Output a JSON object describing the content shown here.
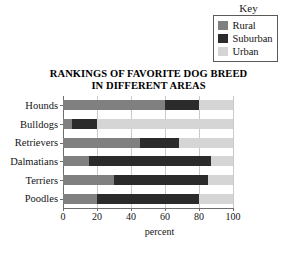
{
  "legend": {
    "title": "Key",
    "position": "top-right",
    "entries": [
      {
        "label": "Rural",
        "color": "#808080"
      },
      {
        "label": "Suburban",
        "color": "#2b2b2b"
      },
      {
        "label": "Urban",
        "color": "#d5d5d5"
      }
    ]
  },
  "chart_data": {
    "type": "bar",
    "orientation": "horizontal",
    "stacked": true,
    "title": "RANKINGS OF FAVORITE DOG BREED IN DIFFERENT AREAS",
    "title_line1": "RANKINGS OF FAVORITE DOG BREED",
    "title_line2": "IN DIFFERENT AREAS",
    "xlabel": "percent",
    "ylabel": "",
    "xlim": [
      0,
      100
    ],
    "xticks": [
      0,
      20,
      40,
      60,
      80,
      100
    ],
    "xtick_labels": [
      "0",
      "20",
      "40",
      "60",
      "80",
      "100"
    ],
    "grid": true,
    "categories": [
      "Hounds",
      "Bulldogs",
      "Retrievers",
      "Dalmatians",
      "Terriers",
      "Poodles"
    ],
    "series": [
      {
        "name": "Rural",
        "color": "#808080",
        "values": [
          60,
          5,
          45,
          15,
          30,
          20
        ]
      },
      {
        "name": "Suburban",
        "color": "#2b2b2b",
        "values": [
          20,
          15,
          23,
          72,
          55,
          60
        ]
      },
      {
        "name": "Urban",
        "color": "#d5d5d5",
        "values": [
          20,
          80,
          32,
          13,
          15,
          20
        ]
      }
    ]
  }
}
